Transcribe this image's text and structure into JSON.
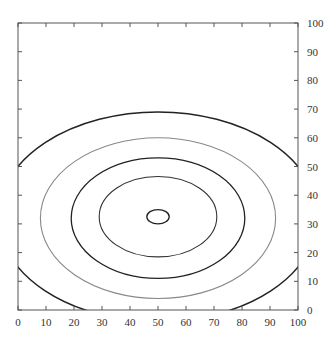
{
  "chart_data": {
    "type": "contour",
    "title": "",
    "xlabel": "",
    "ylabel": "",
    "xlim": [
      0,
      100
    ],
    "ylim": [
      0,
      100
    ],
    "grid": false,
    "legend": null,
    "x_ticks": [
      0,
      10,
      20,
      30,
      40,
      50,
      60,
      70,
      80,
      90,
      100
    ],
    "y_ticks": [
      0,
      10,
      20,
      30,
      40,
      50,
      60,
      70,
      80,
      90,
      100
    ],
    "y_axis_side": "right",
    "center": {
      "x": 50,
      "y": 32.5
    },
    "contours": [
      {
        "level_index": 1,
        "color": "#222222",
        "stroke_width": 1.3,
        "x_extent": [
          46,
          54
        ],
        "y_extent": [
          30,
          35
        ]
      },
      {
        "level_index": 2,
        "color": "#333333",
        "stroke_width": 1.1,
        "x_extent": [
          29,
          71
        ],
        "y_extent": [
          18.5,
          46.5
        ]
      },
      {
        "level_index": 3,
        "color": "#222222",
        "stroke_width": 1.3,
        "x_extent": [
          19,
          81
        ],
        "y_extent": [
          11,
          53
        ]
      },
      {
        "level_index": 4,
        "color": "#888888",
        "stroke_width": 1.1,
        "x_extent": [
          8,
          92
        ],
        "y_extent": [
          4,
          60
        ]
      },
      {
        "level_index": 5,
        "color": "#222222",
        "stroke_width": 1.5,
        "x_extent": [
          -7,
          107
        ],
        "y_extent": [
          -4,
          69
        ],
        "edge_crossings": {
          "left_y": [
            16.5,
            48
          ],
          "right_y": [
            16.5,
            48
          ],
          "bottom_x": [
            21,
            78
          ]
        }
      }
    ]
  },
  "axes": {
    "x_labels": [
      "0",
      "10",
      "20",
      "30",
      "40",
      "50",
      "60",
      "70",
      "80",
      "90",
      "100"
    ],
    "y_labels": [
      "0",
      "10",
      "20",
      "30",
      "40",
      "50",
      "60",
      "70",
      "80",
      "90",
      "100"
    ]
  }
}
